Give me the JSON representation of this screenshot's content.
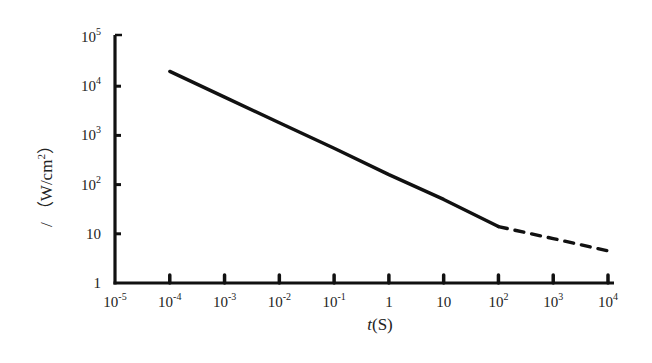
{
  "chart_data": {
    "type": "line",
    "title": "",
    "xlabel": "t(S)",
    "xlabel_parts": {
      "var": "t",
      "unit": "(S)"
    },
    "ylabel": "I (W/cm²)",
    "ylabel_parts": {
      "var": "/",
      "unit": "（W/cm",
      "sup": "2",
      "close": "）"
    },
    "x_scale": "log",
    "y_scale": "log",
    "xlim": [
      1e-05,
      10000.0
    ],
    "ylim": [
      1,
      100000.0
    ],
    "grid": false,
    "legend": null,
    "x_ticks": [
      {
        "base": "10",
        "exp": "-5",
        "value": 1e-05
      },
      {
        "base": "10",
        "exp": "-4",
        "value": 0.0001
      },
      {
        "base": "10",
        "exp": "-3",
        "value": 0.001
      },
      {
        "base": "10",
        "exp": "-2",
        "value": 0.01
      },
      {
        "base": "10",
        "exp": "-1",
        "value": 0.1
      },
      {
        "base": "1",
        "exp": "",
        "value": 1
      },
      {
        "base": "10",
        "exp": "",
        "value": 10
      },
      {
        "base": "10",
        "exp": "2",
        "value": 100
      },
      {
        "base": "10",
        "exp": "3",
        "value": 1000
      },
      {
        "base": "10",
        "exp": "4",
        "value": 10000
      }
    ],
    "y_ticks": [
      {
        "base": "1",
        "exp": "",
        "value": 1
      },
      {
        "base": "10",
        "exp": "",
        "value": 10
      },
      {
        "base": "10",
        "exp": "2",
        "value": 100
      },
      {
        "base": "10",
        "exp": "3",
        "value": 1000
      },
      {
        "base": "10",
        "exp": "4",
        "value": 10000
      },
      {
        "base": "10",
        "exp": "5",
        "value": 100000
      }
    ],
    "series": [
      {
        "name": "measured",
        "style": "solid",
        "color": "#111111",
        "x": [
          0.0001,
          0.001,
          0.01,
          0.1,
          1,
          10,
          100
        ],
        "y": [
          20000,
          6000,
          1800,
          550,
          160,
          50,
          14
        ]
      },
      {
        "name": "extrapolated",
        "style": "dashed",
        "color": "#111111",
        "x": [
          100,
          1000,
          10000
        ],
        "y": [
          14,
          8,
          4.5
        ]
      }
    ]
  }
}
